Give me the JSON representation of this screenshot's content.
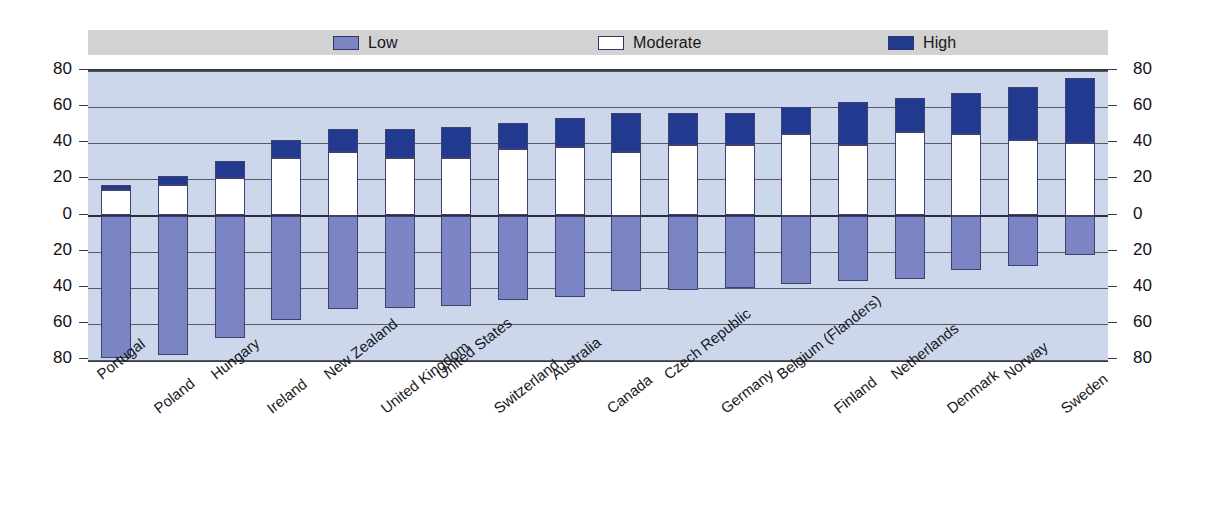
{
  "legend": {
    "entries": [
      {
        "label": "Low",
        "color": "#7b85c4"
      },
      {
        "label": "Moderate",
        "color": "#ffffff"
      },
      {
        "label": "High",
        "color": "#213a8f"
      }
    ],
    "background": "#d2d2d2"
  },
  "axis": {
    "left_ticks": [
      "80",
      "60",
      "40",
      "20",
      "0",
      "20",
      "40",
      "60",
      "80"
    ],
    "right_ticks": [
      "80",
      "60",
      "40",
      "20",
      "0",
      "20",
      "40",
      "60",
      "80"
    ]
  },
  "chart_data": {
    "type": "bar",
    "subtype": "diverging-stacked",
    "title": "",
    "subtitle": "",
    "xlabel": "",
    "ylabel": "",
    "ylim": [
      -80,
      80
    ],
    "ytick_values": [
      80,
      60,
      40,
      20,
      0,
      -20,
      -40,
      -60,
      -80
    ],
    "ytick_labels": [
      "80",
      "60",
      "40",
      "20",
      "0",
      "20",
      "40",
      "60",
      "80"
    ],
    "grid": true,
    "legend_position": "top",
    "note": "Values below the zero line (Low) are plotted downward as positive magnitudes; Moderate and High stack upward.",
    "categories": [
      "Portugal",
      "Poland",
      "Hungary",
      "Ireland",
      "New Zealand",
      "United Kingdom",
      "United States",
      "Switzerland",
      "Australia",
      "Canada",
      "Czech Republic",
      "Germany",
      "Belgium (Flanders)",
      "Finland",
      "Netherlands",
      "Denmark",
      "Norway",
      "Sweden"
    ],
    "series": [
      {
        "name": "Low",
        "color": "#7b85c4",
        "direction": "down",
        "values": [
          79,
          77,
          68,
          58,
          52,
          51,
          50,
          47,
          45,
          42,
          41,
          40,
          38,
          36,
          35,
          30,
          28,
          22
        ]
      },
      {
        "name": "Moderate",
        "color": "#ffffff",
        "direction": "up",
        "values": [
          14,
          17,
          21,
          32,
          35,
          32,
          32,
          37,
          38,
          35,
          39,
          39,
          45,
          39,
          46,
          45,
          42,
          40
        ]
      },
      {
        "name": "High",
        "color": "#213a8f",
        "direction": "up",
        "values": [
          3,
          5,
          9,
          10,
          13,
          16,
          17,
          14,
          16,
          22,
          18,
          18,
          15,
          24,
          19,
          23,
          29,
          36
        ]
      }
    ],
    "totals_up": [
      17,
      22,
      30,
      42,
      48,
      48,
      49,
      51,
      54,
      57,
      57,
      57,
      60,
      63,
      65,
      68,
      71,
      76
    ]
  }
}
